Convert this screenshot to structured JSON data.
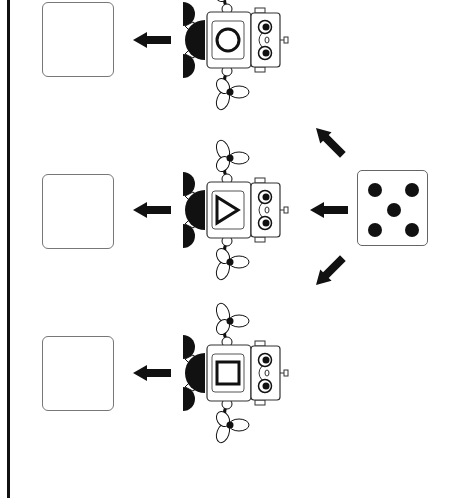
{
  "worksheet": {
    "die": {
      "face_value": 5,
      "pips": [
        {
          "x": 10,
          "y": 12
        },
        {
          "x": 47,
          "y": 12
        },
        {
          "x": 29,
          "y": 32
        },
        {
          "x": 10,
          "y": 52
        },
        {
          "x": 47,
          "y": 52
        }
      ]
    },
    "robots": [
      {
        "id": "top",
        "chest_shape": "circle",
        "center_y": 40
      },
      {
        "id": "middle",
        "chest_shape": "triangle",
        "center_y": 210
      },
      {
        "id": "bottom",
        "chest_shape": "square",
        "center_y": 373
      }
    ],
    "answer_boxes": [
      {
        "id": "top",
        "value": "",
        "top": 2
      },
      {
        "id": "middle",
        "value": "",
        "top": 174
      },
      {
        "id": "bottom",
        "value": "",
        "top": 336
      }
    ],
    "colors": {
      "ink": "#111111",
      "box_border": "#777777",
      "background": "#ffffff"
    }
  }
}
